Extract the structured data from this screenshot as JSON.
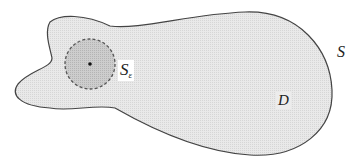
{
  "figure": {
    "labels": {
      "region": "D",
      "boundary": "S",
      "small_sphere_main": "S",
      "small_sphere_subscript": "ε"
    },
    "colors": {
      "region_fill": "#e6e6e6",
      "sphere_fill": "#c8c8c8",
      "outline": "#444444",
      "background": "#ffffff"
    },
    "elements": [
      "blob-shaped region D bounded by closed surface S",
      "small dashed circle S_ε centered at an interior point",
      "center point dot"
    ]
  }
}
